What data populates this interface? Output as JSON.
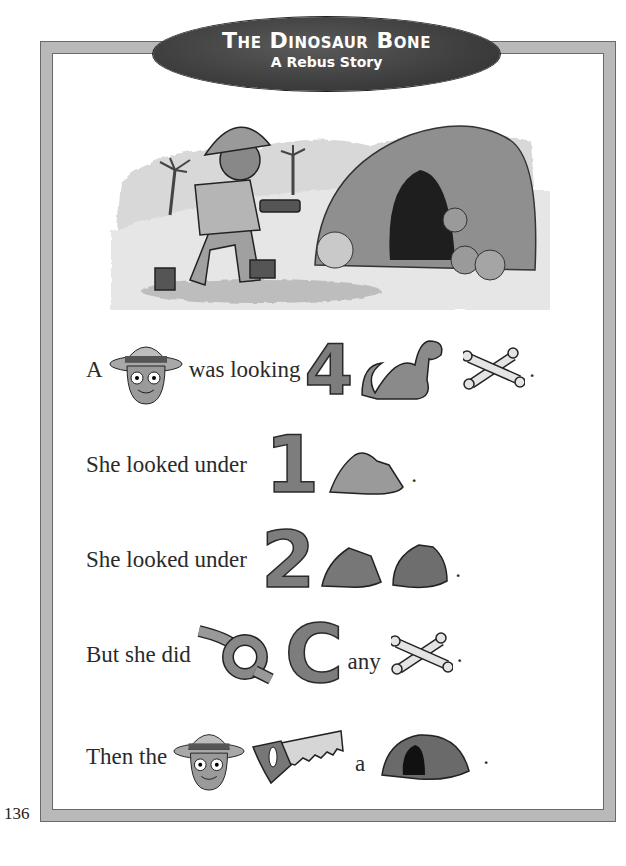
{
  "title": {
    "main": "The Dinosaur Bone",
    "subtitle": "A Rebus Story"
  },
  "page_number": "136",
  "illustration": {
    "description": "Girl explorer in pith helmet with flashlight approaching a rocky cave, palm trees in background"
  },
  "story_lines": [
    {
      "parts": [
        {
          "type": "text",
          "value": "A"
        },
        {
          "type": "icon",
          "name": "girl-explorer-icon",
          "meaning": "girl"
        },
        {
          "type": "text",
          "value": "was looking"
        },
        {
          "type": "numeral",
          "value": "4",
          "meaning": "for"
        },
        {
          "type": "icon",
          "name": "dinosaur-icon",
          "meaning": "dinosaur"
        },
        {
          "type": "icon",
          "name": "crossed-bones-icon",
          "meaning": "bones"
        },
        {
          "type": "text",
          "value": "."
        }
      ]
    },
    {
      "parts": [
        {
          "type": "text",
          "value": "She looked under"
        },
        {
          "type": "numeral",
          "value": "1",
          "meaning": "one"
        },
        {
          "type": "icon",
          "name": "rock-icon",
          "meaning": "rock"
        },
        {
          "type": "text",
          "value": "."
        }
      ]
    },
    {
      "parts": [
        {
          "type": "text",
          "value": "She looked under"
        },
        {
          "type": "numeral",
          "value": "2",
          "meaning": "two"
        },
        {
          "type": "icon",
          "name": "rock-icon",
          "meaning": "rock"
        },
        {
          "type": "icon",
          "name": "rock-icon",
          "meaning": "rocks"
        },
        {
          "type": "text",
          "value": "."
        }
      ]
    },
    {
      "parts": [
        {
          "type": "text",
          "value": "But she did"
        },
        {
          "type": "icon",
          "name": "knot-icon",
          "meaning": "not"
        },
        {
          "type": "numeral",
          "value": "C",
          "meaning": "see"
        },
        {
          "type": "text",
          "value": "any"
        },
        {
          "type": "icon",
          "name": "crossed-bones-icon",
          "meaning": "bones"
        },
        {
          "type": "text",
          "value": "."
        }
      ]
    },
    {
      "parts": [
        {
          "type": "text",
          "value": "Then the"
        },
        {
          "type": "icon",
          "name": "girl-explorer-icon",
          "meaning": "girl"
        },
        {
          "type": "icon",
          "name": "saw-icon",
          "meaning": "saw"
        },
        {
          "type": "text",
          "value": "a"
        },
        {
          "type": "icon",
          "name": "cave-icon",
          "meaning": "cave"
        },
        {
          "type": "text",
          "value": "."
        }
      ]
    }
  ],
  "colors": {
    "frame": "#b9b9b9",
    "frame_border": "#6a6a6a",
    "title_pill": "#3e3e3e",
    "title_text": "#ffffff",
    "numeral_fill": "#7d7d7d",
    "text": "#2a2a2a"
  }
}
